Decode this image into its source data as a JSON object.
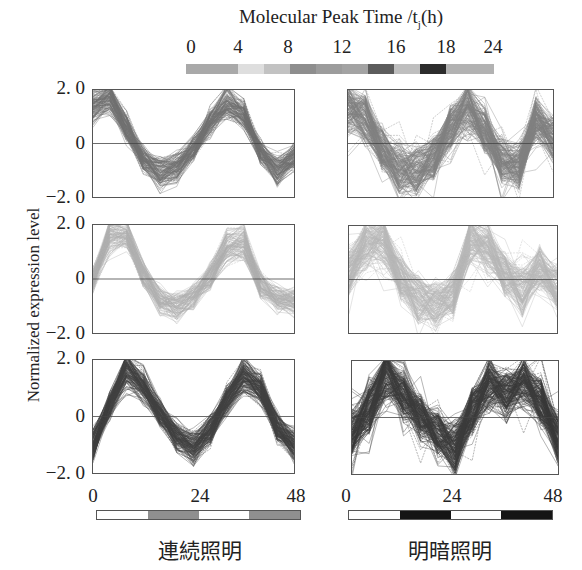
{
  "colorbar": {
    "title": "Molecular Peak Time /t",
    "title_sub": "j",
    "title_unit": "(h)",
    "ticks": [
      {
        "label": "0",
        "x": 191
      },
      {
        "label": "4",
        "x": 238
      },
      {
        "label": "8",
        "x": 288
      },
      {
        "label": "12",
        "x": 342
      },
      {
        "label": "16",
        "x": 396
      },
      {
        "label": "18",
        "x": 446
      },
      {
        "label": "24",
        "x": 493
      }
    ],
    "segments": [
      {
        "color": "#a9a9a9",
        "width": 52
      },
      {
        "color": "#dedede",
        "width": 26
      },
      {
        "color": "#c2c2c2",
        "width": 26
      },
      {
        "color": "#8e8e8e",
        "width": 26
      },
      {
        "color": "#9c9c9c",
        "width": 26
      },
      {
        "color": "#a3a3a3",
        "width": 26
      },
      {
        "color": "#5c5c5c",
        "width": 26
      },
      {
        "color": "#bebebe",
        "width": 26
      },
      {
        "color": "#2c2c2c",
        "width": 26
      },
      {
        "color": "#b2b2b2",
        "width": 48
      }
    ]
  },
  "y_axis": {
    "label": "Normalized expression level",
    "ticks": [
      "2. 0",
      "0",
      "−2. 0"
    ]
  },
  "x_axis": {
    "ticks": [
      "0",
      "24",
      "48"
    ]
  },
  "conditions": [
    {
      "label": "連続照明",
      "light_bar": [
        "#ffffff",
        "#8f8f8f",
        "#ffffff",
        "#8f8f8f"
      ]
    },
    {
      "label": "明暗照明",
      "light_bar": [
        "#ffffff",
        "#151515",
        "#ffffff",
        "#151515"
      ]
    }
  ],
  "chart_data": [
    {
      "type": "line",
      "title": "",
      "panel": "row1-left (連続照明)",
      "group": "peak around t=0-4h (gray)",
      "xlabel": "",
      "ylabel": "Normalized expression level",
      "xlim": [
        0,
        48
      ],
      "ylim": [
        -2.0,
        2.0
      ],
      "x": [
        0,
        4,
        8,
        12,
        16,
        20,
        24,
        28,
        32,
        36,
        40,
        44,
        48
      ],
      "series": [
        {
          "name": "median trace",
          "values": [
            1.4,
            1.7,
            0.6,
            -0.6,
            -1.1,
            -0.9,
            -0.2,
            0.8,
            1.5,
            1.1,
            -0.3,
            -1.0,
            -0.5
          ]
        }
      ],
      "color": "#707070",
      "n_traces_approx": 120,
      "zero_line": true
    },
    {
      "type": "line",
      "panel": "row1-right (明暗照明)",
      "group": "peak around t=0-4h (gray)",
      "xlim": [
        0,
        48
      ],
      "ylim": [
        -2.0,
        2.0
      ],
      "x": [
        0,
        4,
        8,
        12,
        16,
        20,
        24,
        28,
        32,
        36,
        40,
        44,
        48
      ],
      "series": [
        {
          "name": "median trace",
          "values": [
            1.3,
            0.9,
            -0.2,
            -0.9,
            -1.0,
            -0.5,
            0.6,
            1.4,
            0.5,
            -0.6,
            -0.8,
            0.9,
            0.2
          ]
        }
      ],
      "color": "#808080",
      "n_traces_approx": 160,
      "zero_line": true
    },
    {
      "type": "line",
      "panel": "row2-left (連続照明)",
      "group": "peak around t=4-8h (light gray)",
      "xlim": [
        0,
        48
      ],
      "ylim": [
        -2.0,
        2.0
      ],
      "x": [
        0,
        4,
        8,
        12,
        16,
        20,
        24,
        28,
        32,
        36,
        40,
        44,
        48
      ],
      "series": [
        {
          "name": "median trace",
          "values": [
            0.0,
            1.6,
            1.7,
            0.2,
            -0.8,
            -1.0,
            -0.7,
            0.1,
            1.2,
            1.3,
            -0.2,
            -0.7,
            -0.8
          ]
        }
      ],
      "color": "#b0b0b0",
      "n_traces_approx": 100,
      "zero_line": true
    },
    {
      "type": "line",
      "panel": "row2-right (明暗照明)",
      "group": "peak around t=4-8h (light gray)",
      "xlim": [
        0,
        48
      ],
      "ylim": [
        -2.0,
        2.0
      ],
      "x": [
        0,
        4,
        8,
        12,
        16,
        20,
        24,
        28,
        32,
        36,
        40,
        44,
        48
      ],
      "series": [
        {
          "name": "median trace",
          "values": [
            0.3,
            1.3,
            1.4,
            0.0,
            -0.8,
            -0.9,
            -0.6,
            1.5,
            1.2,
            0.2,
            -0.4,
            0.4,
            -0.3
          ]
        }
      ],
      "color": "#b8b8b8",
      "n_traces_approx": 140,
      "zero_line": true
    },
    {
      "type": "line",
      "panel": "row3-left (連続照明)",
      "group": "peak around t=8-12h (dark gray)",
      "xlim": [
        0,
        48
      ],
      "ylim": [
        -2.0,
        2.0
      ],
      "x": [
        0,
        4,
        8,
        12,
        16,
        20,
        24,
        28,
        32,
        36,
        40,
        44,
        48
      ],
      "series": [
        {
          "name": "median trace",
          "values": [
            -1.0,
            0.4,
            1.7,
            1.1,
            0.1,
            -0.7,
            -1.1,
            -0.5,
            0.6,
            1.5,
            1.0,
            -0.4,
            -1.0
          ]
        }
      ],
      "color": "#404040",
      "n_traces_approx": 140,
      "zero_line": true
    },
    {
      "type": "line",
      "panel": "row3-right (明暗照明)",
      "group": "peak around t=8-12h (dark gray)",
      "xlim": [
        0,
        48
      ],
      "ylim": [
        -2.0,
        2.0
      ],
      "x": [
        0,
        4,
        8,
        12,
        16,
        20,
        24,
        28,
        32,
        36,
        40,
        44,
        48
      ],
      "series": [
        {
          "name": "median trace",
          "values": [
            -0.6,
            0.3,
            1.6,
            0.8,
            0.0,
            -0.5,
            -1.1,
            0.2,
            1.2,
            0.8,
            1.2,
            0.5,
            -0.7
          ]
        }
      ],
      "color": "#3a3a3a",
      "n_traces_approx": 180,
      "zero_line": true
    }
  ]
}
